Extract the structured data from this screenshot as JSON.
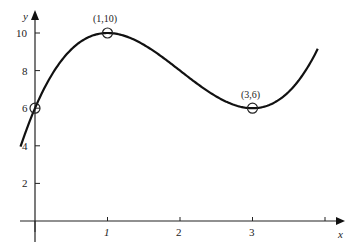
{
  "chart_data": {
    "type": "line",
    "title": "",
    "xlabel": "x",
    "ylabel": "y",
    "xlim": [
      -0.2,
      4.2
    ],
    "ylim": [
      0,
      11
    ],
    "grid": false,
    "legend": null,
    "x_ticks": [
      0,
      1,
      2,
      3
    ],
    "x_tick_labels": [
      "0",
      "1",
      "2",
      "3"
    ],
    "y_ticks": [
      2,
      4,
      6,
      8,
      10
    ],
    "y_tick_labels": [
      "2",
      "4",
      "6",
      "8",
      "10"
    ],
    "function": "y = x^3 - 6x^2 + 9x + 6",
    "series": [
      {
        "name": "curve",
        "x": [
          -0.2,
          0,
          0.5,
          1,
          1.5,
          2,
          2.5,
          3,
          3.5,
          3.9
        ],
        "y": [
          4.0,
          6,
          8.9,
          10,
          9.4,
          8,
          6.6,
          6,
          7.1,
          8.4
        ]
      }
    ],
    "marked_points": [
      {
        "x": 0,
        "y": 6,
        "label": ""
      },
      {
        "x": 1,
        "y": 10,
        "label": "(1,10)"
      },
      {
        "x": 3,
        "y": 6,
        "label": "(3,6)"
      }
    ]
  },
  "labels": {
    "x_axis": "x",
    "y_axis": "y",
    "y_tick_2": "2",
    "y_tick_4": "4",
    "y_tick_6": "6",
    "y_tick_8": "8",
    "y_tick_10": "10",
    "x_tick_1": "1",
    "x_tick_2": "2",
    "x_tick_3": "3",
    "point_max": "(1,10)",
    "point_min": "(3,6)"
  }
}
